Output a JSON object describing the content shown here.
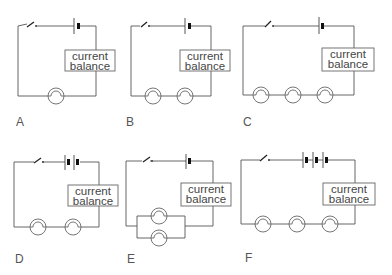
{
  "diagram": {
    "meter_label_line1": "current",
    "meter_label_line2": "balance",
    "circuits": [
      {
        "id": "A",
        "label": "A",
        "cells": 1,
        "bulbs": 1,
        "arrangement": "series"
      },
      {
        "id": "B",
        "label": "B",
        "cells": 1,
        "bulbs": 2,
        "arrangement": "series"
      },
      {
        "id": "C",
        "label": "C",
        "cells": 1,
        "bulbs": 3,
        "arrangement": "series"
      },
      {
        "id": "D",
        "label": "D",
        "cells": 2,
        "bulbs": 2,
        "arrangement": "series"
      },
      {
        "id": "E",
        "label": "E",
        "cells": 1,
        "bulbs": 2,
        "arrangement": "parallel"
      },
      {
        "id": "F",
        "label": "F",
        "cells": 3,
        "bulbs": 3,
        "arrangement": "series"
      }
    ],
    "components": {
      "switch": "switch-icon",
      "cell": "battery-cell-icon",
      "bulb": "lamp-bulb-icon",
      "meter": "current-balance-box"
    },
    "colors": {
      "wire": "#555555",
      "text": "#444444",
      "background": "#ffffff"
    }
  }
}
